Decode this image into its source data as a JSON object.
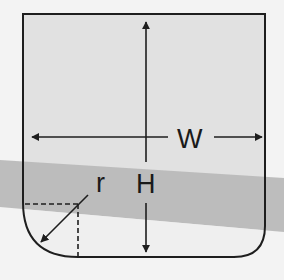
{
  "diagram": {
    "labels": {
      "width": "W",
      "height": "H",
      "radius": "r"
    },
    "colors": {
      "background": "#f3f3f3",
      "box_fill": "#e1e1e1",
      "band_fill": "#b9b9b9",
      "stroke": "#1e1e1e"
    },
    "shape": {
      "description": "Rectangle with rounded bottom corners",
      "left_bottom_corner_radius_label": "r",
      "width_dimension_label": "W",
      "height_dimension_label": "H"
    }
  }
}
